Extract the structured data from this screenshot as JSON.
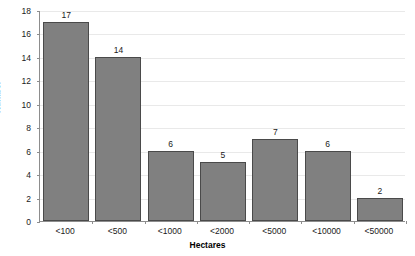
{
  "chart_data": {
    "type": "bar",
    "title": "",
    "subtitle": "",
    "xlabel": "Hectares",
    "ylabel": "Number",
    "categories": [
      "<100",
      "<500",
      "<1000",
      "<2000",
      "<5000",
      "<10000",
      "<50000"
    ],
    "values": [
      17,
      14,
      6,
      5,
      7,
      6,
      2
    ],
    "data_labels": [
      "17",
      "14",
      "6",
      "5",
      "7",
      "6",
      "2"
    ],
    "ylim": [
      0,
      18
    ],
    "ytick_step": 2,
    "ytick_labels": [
      "18",
      "16",
      "14",
      "12",
      "10",
      "8",
      "6",
      "4",
      "2",
      "0"
    ],
    "ytick_values": [
      18,
      16,
      14,
      12,
      10,
      8,
      6,
      4,
      2,
      0
    ],
    "grid": "horizontal",
    "legend": "none",
    "colors": {
      "bar_fill": "#808080",
      "bar_border": "#4a4a4a",
      "gridline": "#e9e9e9",
      "axis_line": "#8d8d8d",
      "text": "#1a1a1a",
      "background": "#ffffff"
    }
  }
}
